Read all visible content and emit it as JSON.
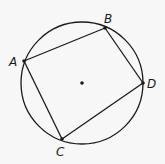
{
  "diagram": {
    "background": "#f7f7f7",
    "stroke_color": "#1a1a1a",
    "circle": {
      "cx": 82,
      "cy": 83,
      "r": 61
    },
    "center_point": {
      "x": 82,
      "y": 83
    },
    "points": [
      {
        "name": "A",
        "label": "A",
        "x": 24,
        "y": 61,
        "label_x": 9,
        "label_y": 66
      },
      {
        "name": "B",
        "label": "B",
        "x": 105,
        "y": 28,
        "label_x": 104,
        "label_y": 23
      },
      {
        "name": "D",
        "label": "D",
        "x": 143,
        "y": 83,
        "label_x": 147,
        "label_y": 88
      },
      {
        "name": "C",
        "label": "C",
        "x": 62,
        "y": 139,
        "label_x": 56,
        "label_y": 156
      }
    ],
    "segments": [
      [
        "A",
        "B"
      ],
      [
        "B",
        "D"
      ],
      [
        "D",
        "C"
      ],
      [
        "C",
        "A"
      ]
    ]
  }
}
